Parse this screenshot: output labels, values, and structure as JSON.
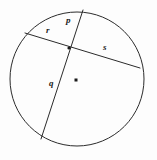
{
  "figure": {
    "background_color": "#fdfdfd",
    "stroke_color": "#2b2b2b",
    "label_color": "#1a1a1a"
  },
  "circle": {
    "center_x": 77,
    "center_y": 79,
    "radius": 67,
    "stroke_width": 1
  },
  "center_marker": {
    "name": "center-point",
    "x": 76,
    "y": 80,
    "size": 3,
    "color": "#1a1a1a"
  },
  "intersection": {
    "x": 69,
    "y": 48
  },
  "chords": [
    {
      "name": "chord-p-q",
      "x1": 83,
      "y1": 10,
      "x2": 41,
      "y2": 139
    },
    {
      "name": "chord-r-s",
      "x1": 25,
      "y1": 33,
      "x2": 140,
      "y2": 68
    }
  ],
  "labels": [
    {
      "id": "p",
      "text": "p",
      "x": 66,
      "y": 16
    },
    {
      "id": "r",
      "text": "r",
      "x": 46,
      "y": 26
    },
    {
      "id": "s",
      "text": "s",
      "x": 103,
      "y": 43
    },
    {
      "id": "q",
      "text": "q",
      "x": 49,
      "y": 79
    }
  ]
}
